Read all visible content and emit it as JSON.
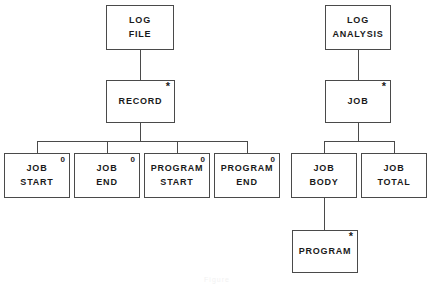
{
  "diagram": {
    "caption": "Figure",
    "line_color": "#4a4a4a",
    "text_color": "#1a1a1a",
    "background": "#ffffff",
    "markers": {
      "iteration": "*",
      "selection": "0"
    },
    "trees": [
      {
        "name": "log-file-tree",
        "root": "LOG FILE"
      },
      {
        "name": "log-analysis-tree",
        "root": "LOG ANALYSIS"
      }
    ],
    "nodes": [
      {
        "id": "log-file",
        "line1": "LOG",
        "line2": "FILE",
        "marker": "",
        "x": 106,
        "y": 5,
        "w": 68,
        "h": 45
      },
      {
        "id": "record",
        "line1": "RECORD",
        "line2": "",
        "marker": "*",
        "x": 106,
        "y": 80,
        "w": 69,
        "h": 43
      },
      {
        "id": "job-start",
        "line1": "JOB",
        "line2": "START",
        "marker": "0",
        "x": 4,
        "y": 153,
        "w": 66,
        "h": 45
      },
      {
        "id": "job-end",
        "line1": "JOB",
        "line2": "END",
        "marker": "0",
        "x": 74,
        "y": 153,
        "w": 66,
        "h": 45
      },
      {
        "id": "program-start",
        "line1": "PROGRAM",
        "line2": "START",
        "marker": "0",
        "x": 144,
        "y": 153,
        "w": 66,
        "h": 45
      },
      {
        "id": "program-end",
        "line1": "PROGRAM",
        "line2": "END",
        "marker": "0",
        "x": 214,
        "y": 153,
        "w": 66,
        "h": 45
      },
      {
        "id": "log-analysis",
        "line1": "LOG",
        "line2": "ANALYSIS",
        "marker": "",
        "x": 325,
        "y": 5,
        "w": 66,
        "h": 45
      },
      {
        "id": "job",
        "line1": "JOB",
        "line2": "",
        "marker": "*",
        "x": 325,
        "y": 80,
        "w": 66,
        "h": 43
      },
      {
        "id": "job-body",
        "line1": "JOB",
        "line2": "BODY",
        "marker": "",
        "x": 291,
        "y": 153,
        "w": 66,
        "h": 45
      },
      {
        "id": "job-total",
        "line1": "JOB",
        "line2": "TOTAL",
        "marker": "",
        "x": 361,
        "y": 153,
        "w": 66,
        "h": 45
      },
      {
        "id": "program",
        "line1": "PROGRAM",
        "line2": "",
        "marker": "*",
        "x": 292,
        "y": 230,
        "w": 66,
        "h": 43
      }
    ],
    "connectors": [
      {
        "id": "logfile-to-record",
        "orient": "v",
        "x": 140,
        "y": 50,
        "len": 30
      },
      {
        "id": "record-to-bar",
        "orient": "v",
        "x": 140,
        "y": 123,
        "len": 18
      },
      {
        "id": "record-children-bar",
        "orient": "h",
        "x": 37,
        "y": 141,
        "len": 211
      },
      {
        "id": "bar-to-job-start",
        "orient": "v",
        "x": 37,
        "y": 141,
        "len": 12
      },
      {
        "id": "bar-to-job-end",
        "orient": "v",
        "x": 107,
        "y": 141,
        "len": 12
      },
      {
        "id": "bar-to-prog-start",
        "orient": "v",
        "x": 177,
        "y": 141,
        "len": 12
      },
      {
        "id": "bar-to-prog-end",
        "orient": "v",
        "x": 247,
        "y": 141,
        "len": 12
      },
      {
        "id": "analysis-to-job",
        "orient": "v",
        "x": 358,
        "y": 50,
        "len": 30
      },
      {
        "id": "job-to-bar",
        "orient": "v",
        "x": 358,
        "y": 123,
        "len": 18
      },
      {
        "id": "job-children-bar",
        "orient": "h",
        "x": 324,
        "y": 141,
        "len": 70
      },
      {
        "id": "bar-to-job-body",
        "orient": "v",
        "x": 324,
        "y": 141,
        "len": 12
      },
      {
        "id": "bar-to-job-total",
        "orient": "v",
        "x": 394,
        "y": 141,
        "len": 12
      },
      {
        "id": "jobbody-to-program",
        "orient": "v",
        "x": 324,
        "y": 198,
        "len": 32
      }
    ]
  }
}
